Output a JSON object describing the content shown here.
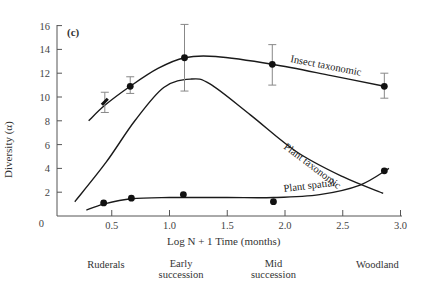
{
  "chart_data": {
    "type": "line",
    "panel_label": "(c)",
    "title": "",
    "xlabel": "Log N + 1 Time (months)",
    "ylabel": "Diversity (α)",
    "xlim": [
      0,
      3.0
    ],
    "ylim": [
      0,
      16
    ],
    "x_ticks": [
      "0",
      "0.5",
      "1.0",
      "1.5",
      "2.0",
      "2.5",
      "3.0"
    ],
    "y_ticks": [
      "0",
      "2",
      "4",
      "6",
      "8",
      "10",
      "12",
      "14",
      "16"
    ],
    "grid": false,
    "legend": "inline curve labels",
    "stage_labels": [
      {
        "text": "Ruderals",
        "x": 0.45
      },
      {
        "text": "Early\nsuccession",
        "x": 1.1
      },
      {
        "text": "Mid\nsuccession",
        "x": 1.9
      },
      {
        "text": "Woodland",
        "x": 2.8
      }
    ],
    "series": [
      {
        "name": "Insect taxonomic",
        "points": [
          {
            "x": 0.44,
            "y": 9.6,
            "err_low": 8.7,
            "err_high": 10.4,
            "marker": "dash"
          },
          {
            "x": 0.66,
            "y": 10.9,
            "err_low": 10.3,
            "err_high": 11.7
          },
          {
            "x": 1.13,
            "y": 13.3,
            "err_low": 10.5,
            "err_high": 16.1
          },
          {
            "x": 1.89,
            "y": 12.75,
            "err_low": 11.0,
            "err_high": 14.4
          },
          {
            "x": 2.86,
            "y": 10.9,
            "err_low": 9.9,
            "err_high": 12.0
          }
        ],
        "curve": [
          [
            0.3,
            8.0
          ],
          [
            0.44,
            9.3
          ],
          [
            0.66,
            10.9
          ],
          [
            0.9,
            12.4
          ],
          [
            1.13,
            13.3
          ],
          [
            1.4,
            13.4
          ],
          [
            1.89,
            12.75
          ],
          [
            2.4,
            11.8
          ],
          [
            2.86,
            10.9
          ]
        ]
      },
      {
        "name": "Plant taxonomic",
        "points": [],
        "curve": [
          [
            0.18,
            1.2
          ],
          [
            0.45,
            4.5
          ],
          [
            0.7,
            8.0
          ],
          [
            0.95,
            10.8
          ],
          [
            1.18,
            11.5
          ],
          [
            1.35,
            11.1
          ],
          [
            1.7,
            8.5
          ],
          [
            2.1,
            5.4
          ],
          [
            2.5,
            3.3
          ],
          [
            2.85,
            1.9
          ]
        ]
      },
      {
        "name": "Plant spatial",
        "points": [
          {
            "x": 0.43,
            "y": 1.1
          },
          {
            "x": 0.67,
            "y": 1.5
          },
          {
            "x": 1.12,
            "y": 1.8
          },
          {
            "x": 1.9,
            "y": 1.2
          },
          {
            "x": 2.86,
            "y": 3.8
          }
        ],
        "curve": [
          [
            0.28,
            0.5
          ],
          [
            0.43,
            1.0
          ],
          [
            0.67,
            1.45
          ],
          [
            1.0,
            1.55
          ],
          [
            1.5,
            1.55
          ],
          [
            1.9,
            1.55
          ],
          [
            2.3,
            1.8
          ],
          [
            2.65,
            2.6
          ],
          [
            2.9,
            4.0
          ]
        ]
      }
    ]
  }
}
